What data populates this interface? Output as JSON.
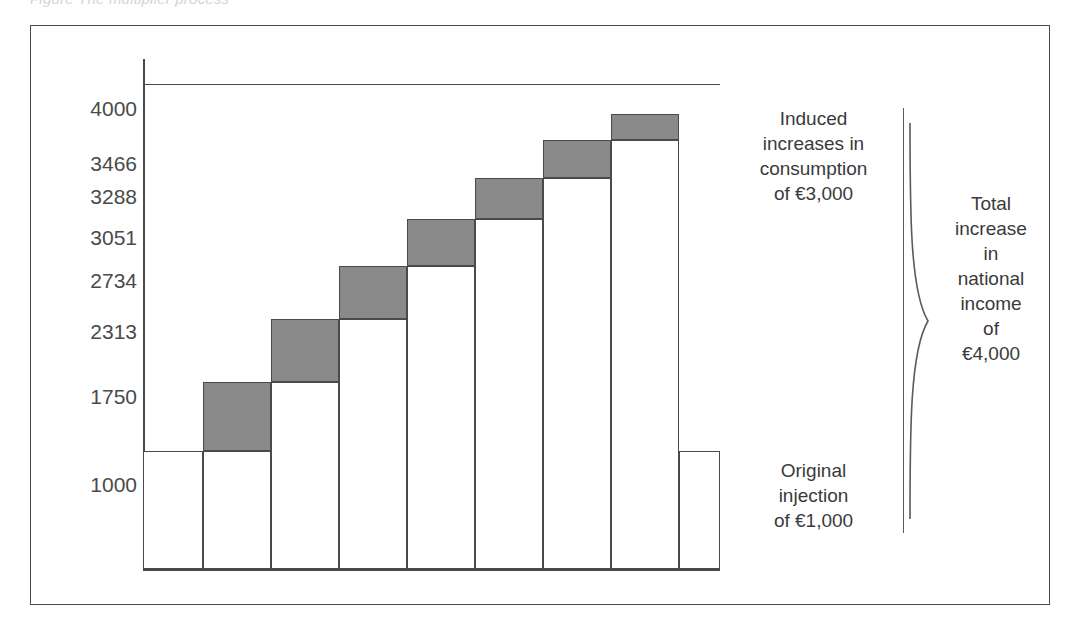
{
  "caption": {
    "text": "Figure   The multiplier process"
  },
  "chart_data": {
    "type": "bar",
    "title": "",
    "subtitle": "",
    "xlabel": "",
    "ylabel": "",
    "grid": true,
    "legend_position": "right",
    "ylim": [
      0,
      4000
    ],
    "ytick_labels": [
      "4000",
      "3466",
      "3288",
      "3051",
      "2734",
      "2313",
      "1750",
      "1000"
    ],
    "ytick_values": [
      4000,
      3466,
      3288,
      3051,
      2734,
      2313,
      1750,
      1000
    ],
    "base_value": 1000,
    "categories": [
      "round 0",
      "round 1",
      "round 2",
      "round 3",
      "round 4",
      "round 5",
      "round 6",
      "round 7"
    ],
    "series": [
      {
        "name": "Cumulative national income",
        "values": [
          1000,
          1750,
          2313,
          2734,
          3051,
          3288,
          3466,
          3600
        ]
      },
      {
        "name": "Induced increment (shaded)",
        "values": [
          0,
          750,
          563,
          421,
          317,
          237,
          178,
          134
        ]
      }
    ],
    "annotations": [
      "Induced increases in consumption of €3,000",
      "Original injection of €1,000",
      "Total increase in national income of €4,000"
    ],
    "colors": {
      "shade": "#8a8a8a",
      "bar_fill": "#ffffff",
      "stroke": "#4a4a4a",
      "text": "#3a3a3a"
    }
  },
  "y_axis": {
    "labels": [
      {
        "text": "4000",
        "top": 72
      },
      {
        "text": "3466",
        "top": 127
      },
      {
        "text": "3288",
        "top": 160
      },
      {
        "text": "3051",
        "top": 201
      },
      {
        "text": "2734",
        "top": 244
      },
      {
        "text": "2313",
        "top": 295
      },
      {
        "text": "1750",
        "top": 360
      },
      {
        "text": "1000",
        "top": 448
      }
    ]
  },
  "bars": [
    {
      "name": "bar-1",
      "left": 112,
      "width": 60,
      "body_top": 425,
      "body_height": 118,
      "shade_top": null,
      "shade_height": 0
    },
    {
      "name": "bar-2",
      "left": 172,
      "width": 68,
      "body_top": 425,
      "body_height": 118,
      "shade_top": 356,
      "shade_height": 69
    },
    {
      "name": "bar-3",
      "left": 240,
      "width": 68,
      "body_top": 356,
      "body_height": 187,
      "shade_top": 293,
      "shade_height": 63
    },
    {
      "name": "bar-4",
      "left": 308,
      "width": 68,
      "body_top": 293,
      "body_height": 250,
      "shade_top": 240,
      "shade_height": 53
    },
    {
      "name": "bar-5",
      "left": 376,
      "width": 68,
      "body_top": 240,
      "body_height": 303,
      "shade_top": 193,
      "shade_height": 47
    },
    {
      "name": "bar-6",
      "left": 444,
      "width": 68,
      "body_top": 193,
      "body_height": 350,
      "shade_top": 152,
      "shade_height": 41
    },
    {
      "name": "bar-7",
      "left": 512,
      "width": 68,
      "body_top": 152,
      "body_height": 391,
      "shade_top": 114,
      "shade_height": 38
    },
    {
      "name": "bar-8",
      "left": 580,
      "width": 68,
      "body_top": 114,
      "body_height": 429,
      "shade_top": 88,
      "shade_height": 26
    },
    {
      "name": "bar-9",
      "left": 648,
      "width": 41,
      "body_top": 425,
      "body_height": 118,
      "shade_top": null,
      "shade_height": 0
    }
  ],
  "annotations": {
    "induced": {
      "line1": "Induced",
      "line2": "increases in",
      "line3": "consumption",
      "line4": "of €3,000"
    },
    "original": {
      "line1": "Original",
      "line2": "injection",
      "line3": "of €1,000"
    },
    "total": {
      "line1": "Total",
      "line2": "increase",
      "line3": "in",
      "line4": "national",
      "line5": "income",
      "line6": "of",
      "line7": "€4,000"
    }
  }
}
